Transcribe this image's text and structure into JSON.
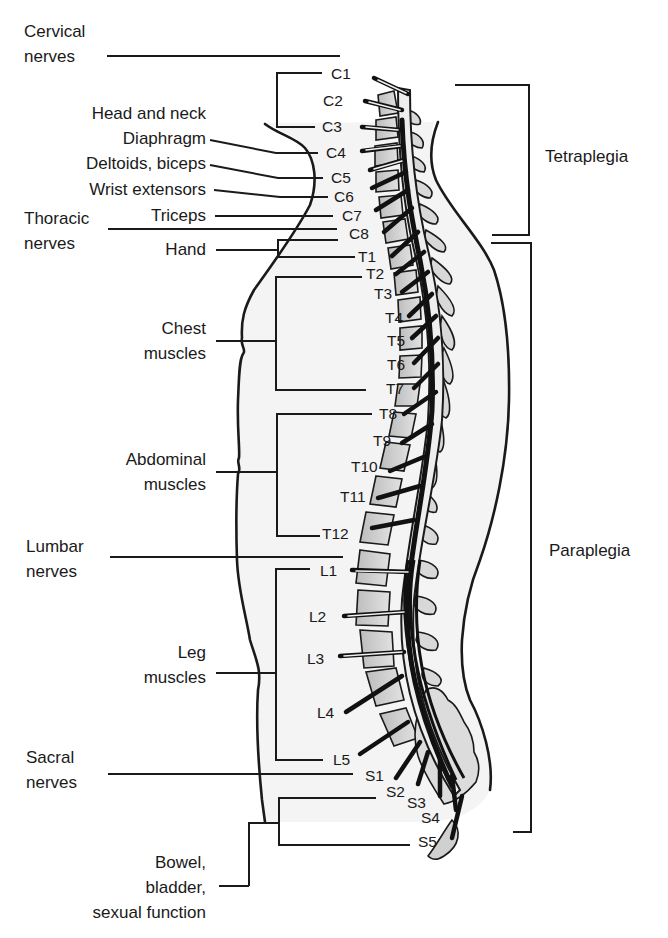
{
  "nerve_groups": [
    {
      "label_line1": "Cervical",
      "label_line2": "nerves"
    },
    {
      "label_line1": "Thoracic",
      "label_line2": "nerves"
    },
    {
      "label_line1": "Lumbar",
      "label_line2": "nerves"
    },
    {
      "label_line1": "Sacral",
      "label_line2": "nerves"
    }
  ],
  "functions": [
    {
      "label": "Head and neck",
      "segments": "C1–C3"
    },
    {
      "label": "Diaphragm",
      "segments": "C4"
    },
    {
      "label": "Deltoids, biceps",
      "segments": "C5"
    },
    {
      "label": "Wrist extensors",
      "segments": "C6"
    },
    {
      "label": "Triceps",
      "segments": "C7"
    },
    {
      "label": "Hand",
      "segments": "C8–T1"
    },
    {
      "label_line1": "Chest",
      "label_line2": "muscles",
      "segments": "T2–T7"
    },
    {
      "label_line1": "Abdominal",
      "label_line2": "muscles",
      "segments": "T8–T12"
    },
    {
      "label_line1": "Leg",
      "label_line2": "muscles",
      "segments": "L1–L5"
    },
    {
      "label_line1": "Bowel,",
      "label_line2": "bladder,",
      "label_line3": "sexual function",
      "segments": "S2–S5"
    }
  ],
  "segments": {
    "cervical": [
      "C1",
      "C2",
      "C3",
      "C4",
      "C5",
      "C6",
      "C7",
      "C8"
    ],
    "thoracic": [
      "T1",
      "T2",
      "T3",
      "T4",
      "T5",
      "T6",
      "T7",
      "T8",
      "T9",
      "T10",
      "T11",
      "T12"
    ],
    "lumbar": [
      "L1",
      "L2",
      "L3",
      "L4",
      "L5"
    ],
    "sacral": [
      "S1",
      "S2",
      "S3",
      "S4",
      "S5"
    ]
  },
  "injury_levels": [
    {
      "label": "Tetraplegia",
      "range": "C1–C8"
    },
    {
      "label": "Paraplegia",
      "range": "T1–S5"
    }
  ],
  "colors": {
    "ink": "#1a1a1a",
    "body_fill": "#f4f4f4",
    "vertebra_fill": "#cfcfcf",
    "cord_fill": "#e6e6e6"
  }
}
